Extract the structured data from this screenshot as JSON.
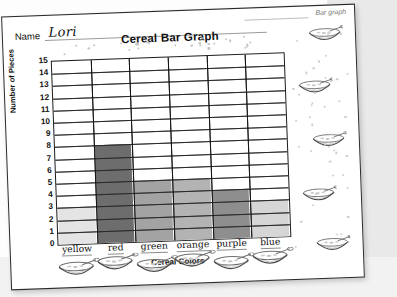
{
  "worksheet": {
    "name_label": "Name",
    "name_value": "Lori",
    "title": "Cereal Bar Graph",
    "corner_tag": "Bar graph"
  },
  "chart_data": {
    "type": "bar",
    "title": "Cereal Bar Graph",
    "xlabel": "Cereal Colors",
    "ylabel": "Number of Pieces",
    "categories": [
      "yellow",
      "red",
      "green",
      "orange",
      "purple",
      "blue"
    ],
    "values": [
      3,
      8,
      5,
      5,
      4,
      3
    ],
    "ylim": [
      0,
      15
    ],
    "yticks": [
      0,
      1,
      2,
      3,
      4,
      5,
      6,
      7,
      8,
      9,
      10,
      11,
      12,
      13,
      14,
      15
    ],
    "grid": true,
    "legend": "none",
    "bar_colors": [
      "#e4e4e4",
      "#6d6d6d",
      "#a3a3a3",
      "#b3b3b3",
      "#8e8e8e",
      "#d6d6d6"
    ]
  },
  "icons": {
    "cereal_bowl": "cereal-bowl-icon"
  }
}
